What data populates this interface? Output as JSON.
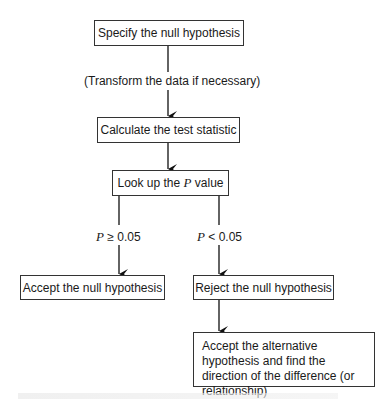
{
  "diagram": {
    "type": "flowchart",
    "nodes": {
      "specify": "Specify the null hypothesis",
      "transform": "(Transform the data if necessary)",
      "calculate": "Calculate the test statistic",
      "lookup_prefix": "Look up the ",
      "lookup_var": "P",
      "lookup_suffix": " value",
      "accept_null": "Accept the null hypothesis",
      "reject_null": "Reject the null hypothesis",
      "accept_alt": "Accept the alternative hypothesis and find the direction of the difference (or relationship)"
    },
    "edges": {
      "left_var": "P",
      "left_cond": " ≥ 0.05",
      "right_var": "P",
      "right_cond": " < 0.05"
    }
  }
}
